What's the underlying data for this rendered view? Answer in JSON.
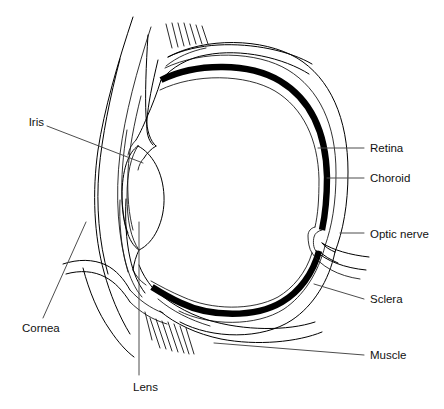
{
  "diagram": {
    "background_color": "#ffffff",
    "line_color": "#000000",
    "leader_color": "#4d4d4d",
    "label_color": "#111111"
  },
  "labels": {
    "iris": "Iris",
    "cornea": "Cornea",
    "lens": "Lens",
    "retina": "Retina",
    "choroid": "Choroid",
    "optic_nerve": "Optic nerve",
    "sclera": "Sclera",
    "muscle": "Muscle"
  },
  "structures": [
    {
      "name": "iris",
      "label": "Iris",
      "side": "left"
    },
    {
      "name": "cornea",
      "label": "Cornea",
      "side": "left"
    },
    {
      "name": "lens",
      "label": "Lens",
      "side": "bottom"
    },
    {
      "name": "retina",
      "label": "Retina",
      "side": "right"
    },
    {
      "name": "choroid",
      "label": "Choroid",
      "side": "right"
    },
    {
      "name": "optic-nerve",
      "label": "Optic nerve",
      "side": "right"
    },
    {
      "name": "sclera",
      "label": "Sclera",
      "side": "right"
    },
    {
      "name": "muscle",
      "label": "Muscle",
      "side": "right"
    }
  ]
}
